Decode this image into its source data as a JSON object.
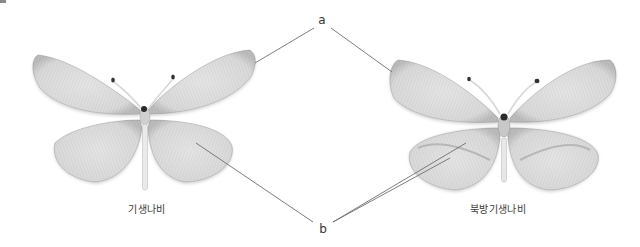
{
  "figure": {
    "type": "specimen comparison diagram",
    "background": "#ffffff",
    "line_color": "#6e6e6e"
  },
  "specimens": [
    {
      "id": "left",
      "caption": "기생나비",
      "cx": 144,
      "cy": 122
    },
    {
      "id": "right",
      "caption": "북방기생나비",
      "cx": 502,
      "cy": 125
    }
  ],
  "pointers": [
    {
      "label": "a",
      "x": 322,
      "y": 20,
      "targets": [
        {
          "x": 255,
          "y": 63
        },
        {
          "x": 392,
          "y": 72
        }
      ]
    },
    {
      "label": "b",
      "x": 323,
      "y": 229,
      "targets": [
        {
          "x": 196,
          "y": 143
        },
        {
          "x": 466,
          "y": 143
        },
        {
          "x": 450,
          "y": 158
        }
      ]
    }
  ]
}
